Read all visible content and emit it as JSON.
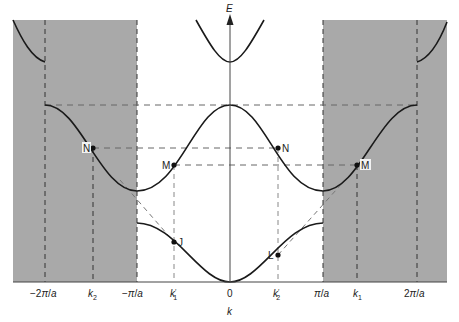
{
  "figure": {
    "type": "band-structure-extended-zone",
    "y_axis_label": "E",
    "x_axis_label": "k",
    "x_ticks": [
      {
        "label": "-2π/a",
        "x": 45
      },
      {
        "label": "k",
        "sub": "2",
        "x": 93
      },
      {
        "label": "-π/a",
        "x": 137
      },
      {
        "label": "k",
        "sub": "1",
        "prime": true,
        "x": 174
      },
      {
        "label": "0",
        "x": 230
      },
      {
        "label": "k",
        "sub": "2",
        "prime": true,
        "x": 278
      },
      {
        "label": "π/a",
        "x": 323
      },
      {
        "label": "k",
        "sub": "1",
        "x": 357
      },
      {
        "label": "2π/a",
        "x": 417
      }
    ],
    "points": [
      {
        "label": "N",
        "x": 93,
        "y": 148,
        "side": "left"
      },
      {
        "label": "M",
        "x": 174,
        "y": 165,
        "side": "left"
      },
      {
        "label": "J",
        "x": 174,
        "y": 242,
        "side": "right"
      },
      {
        "label": "N",
        "x": 278,
        "y": 148,
        "side": "right"
      },
      {
        "label": "L",
        "x": 278,
        "y": 255,
        "side": "left"
      },
      {
        "label": "M",
        "x": 357,
        "y": 165,
        "side": "right"
      }
    ],
    "shaded_regions": [
      "-2π/a to -π/a (second zone, left)",
      "π/a to 2π/a (second zone, right)"
    ],
    "colors": {
      "shade": "#a9a9a9",
      "line": "#1a1a1a",
      "dash": "#555555"
    }
  }
}
